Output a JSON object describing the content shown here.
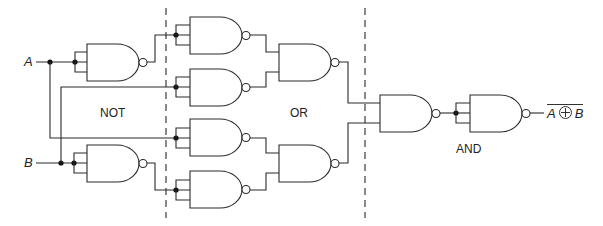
{
  "diagram": {
    "type": "logic-circuit",
    "inputs": [
      {
        "id": "A",
        "label": "A"
      },
      {
        "id": "B",
        "label": "B"
      }
    ],
    "sections": [
      {
        "id": "not",
        "label": "NOT"
      },
      {
        "id": "or",
        "label": "OR"
      },
      {
        "id": "and",
        "label": "AND"
      }
    ],
    "output": {
      "label_left": "A",
      "operator": "⊕",
      "label_right": "B",
      "overline": true
    },
    "gate_type": "NAND",
    "gate_count": 9,
    "colors": {
      "line": "#2a2a2a",
      "background": "#ffffff"
    }
  }
}
